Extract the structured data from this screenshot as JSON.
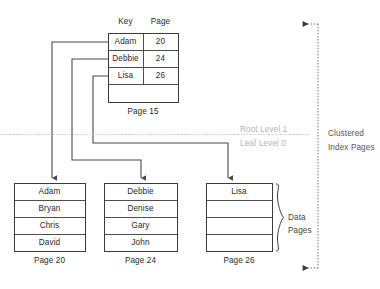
{
  "diagram": {
    "title_colors": {
      "stroke": "#3b3b3b",
      "connector": "#4a4a4a",
      "divider": "#c9c9c9",
      "level_text": "#b4b4b4",
      "background": "#ffffff"
    },
    "root_page": {
      "columns": [
        "Key",
        "Page"
      ],
      "rows": [
        {
          "key": "Adam",
          "page": "20"
        },
        {
          "key": "Debbie",
          "page": "24"
        },
        {
          "key": "Lisa",
          "page": "26"
        }
      ],
      "empty_rows": 1,
      "label": "Page 15"
    },
    "levels": {
      "root": "Root Level 1",
      "leaf": "Leaf Level 0"
    },
    "annotations": {
      "clustered_index_pages_line1": "Clustered",
      "clustered_index_pages_line2": "Index Pages",
      "data_pages_line1": "Data",
      "data_pages_line2": "Pages"
    },
    "data_pages": [
      {
        "label": "Page 20",
        "rows": [
          "Adam",
          "Bryan",
          "Chris",
          "David"
        ]
      },
      {
        "label": "Page 24",
        "rows": [
          "Debbie",
          "Denise",
          "Gary",
          "John"
        ]
      },
      {
        "label": "Page 26",
        "rows": [
          "Lisa",
          "",
          "",
          ""
        ]
      }
    ]
  }
}
